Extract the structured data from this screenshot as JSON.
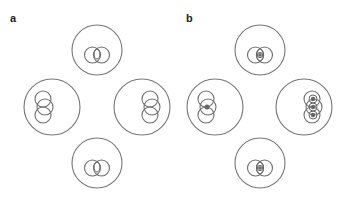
{
  "figure": {
    "panels": [
      {
        "label": "a",
        "description": "Four cell outlines each containing two overlapping circles without central markers",
        "cells": [
          {
            "position": "top",
            "orientation": "horizontal",
            "pair_count": 2,
            "has_center_marker": false,
            "inner_oval": true
          },
          {
            "position": "left",
            "orientation": "vertical",
            "pair_count": 3,
            "has_center_marker": false,
            "inner_oval": false
          },
          {
            "position": "right",
            "orientation": "vertical",
            "pair_count": 3,
            "has_center_marker": false,
            "inner_oval": false
          },
          {
            "position": "bottom",
            "orientation": "horizontal",
            "pair_count": 2,
            "has_center_marker": false,
            "inner_oval": true
          }
        ]
      },
      {
        "label": "b",
        "description": "Four cell outlines each containing overlapping circles with central filled markers",
        "cells": [
          {
            "position": "top",
            "orientation": "horizontal",
            "pair_count": 2,
            "has_center_marker": true,
            "marker_count": 1
          },
          {
            "position": "left",
            "orientation": "vertical",
            "pair_count": 3,
            "has_center_marker": true,
            "marker_count": 1
          },
          {
            "position": "right",
            "orientation": "vertical",
            "pair_count": 3,
            "has_center_marker": true,
            "marker_count": 3
          },
          {
            "position": "bottom",
            "orientation": "horizontal",
            "pair_count": 2,
            "has_center_marker": true,
            "marker_count": 1
          }
        ]
      }
    ],
    "colors": {
      "stroke": "#777777",
      "marker": "#666666",
      "label": "#222222",
      "background": "#ffffff"
    }
  }
}
